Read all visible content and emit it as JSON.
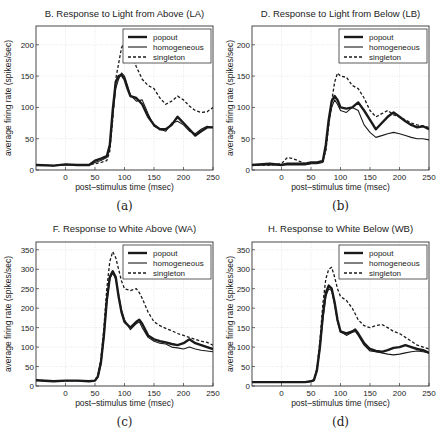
{
  "chart_data": [
    {
      "id": "a",
      "type": "line",
      "title": "B. Response to Light from Above (LA)",
      "xlabel": "post–stimulus time (msec)",
      "ylabel": "average firing rate (spikes/sec)",
      "caption": "(a)",
      "xlim": [
        -50,
        250
      ],
      "ylim": [
        0,
        230
      ],
      "xticks": [
        0,
        50,
        100,
        150,
        200,
        250
      ],
      "yticks": [
        0,
        50,
        100,
        150,
        200
      ],
      "grid": true,
      "legend_position": "upper right",
      "x": [
        -50,
        -20,
        0,
        20,
        40,
        50,
        60,
        70,
        75,
        80,
        85,
        90,
        95,
        100,
        105,
        110,
        120,
        130,
        140,
        150,
        160,
        170,
        180,
        190,
        200,
        210,
        220,
        230,
        240,
        250
      ],
      "series": [
        {
          "name": "popout",
          "style": "thick-solid",
          "values": [
            8,
            7,
            9,
            8,
            8,
            15,
            18,
            22,
            40,
            95,
            140,
            150,
            152,
            145,
            130,
            118,
            115,
            105,
            85,
            72,
            65,
            65,
            72,
            85,
            75,
            65,
            55,
            62,
            68,
            68
          ]
        },
        {
          "name": "homogeneous",
          "style": "thin-solid",
          "values": [
            8,
            7,
            8,
            8,
            8,
            12,
            15,
            20,
            35,
            85,
            130,
            145,
            155,
            150,
            135,
            120,
            110,
            112,
            90,
            70,
            65,
            62,
            75,
            78,
            72,
            62,
            58,
            65,
            70,
            68
          ]
        },
        {
          "name": "singleton",
          "style": "dashed",
          "values": [
            8,
            7,
            9,
            8,
            8,
            10,
            12,
            15,
            30,
            80,
            145,
            170,
            195,
            205,
            205,
            190,
            165,
            145,
            135,
            130,
            115,
            105,
            110,
            118,
            112,
            102,
            95,
            92,
            93,
            100
          ]
        }
      ]
    },
    {
      "id": "b",
      "type": "line",
      "title": "D. Response to Light from Below (LB)",
      "xlabel": "post–stimulus time (msec)",
      "ylabel": "average firing rate (spikes/sec)",
      "caption": "(b)",
      "xlim": [
        -50,
        250
      ],
      "ylim": [
        0,
        230
      ],
      "xticks": [
        0,
        50,
        100,
        150,
        200,
        250
      ],
      "yticks": [
        0,
        50,
        100,
        150,
        200
      ],
      "grid": true,
      "legend_position": "upper right",
      "x": [
        -50,
        -20,
        0,
        10,
        20,
        40,
        50,
        60,
        70,
        75,
        80,
        85,
        90,
        95,
        100,
        110,
        120,
        130,
        140,
        150,
        160,
        170,
        180,
        190,
        200,
        210,
        220,
        230,
        240,
        250
      ],
      "series": [
        {
          "name": "popout",
          "style": "thick-solid",
          "values": [
            8,
            10,
            8,
            10,
            10,
            10,
            12,
            12,
            14,
            40,
            80,
            110,
            118,
            112,
            100,
            98,
            100,
            108,
            95,
            80,
            65,
            75,
            85,
            92,
            85,
            78,
            72,
            68,
            70,
            65
          ]
        },
        {
          "name": "homogeneous",
          "style": "thin-solid",
          "values": [
            8,
            8,
            8,
            8,
            8,
            8,
            10,
            10,
            12,
            35,
            75,
            100,
            112,
            105,
            95,
            92,
            100,
            95,
            72,
            60,
            52,
            55,
            58,
            60,
            58,
            55,
            52,
            50,
            50,
            48
          ]
        },
        {
          "name": "singleton",
          "style": "dashed",
          "values": [
            8,
            8,
            10,
            20,
            18,
            10,
            10,
            12,
            15,
            30,
            70,
            110,
            140,
            155,
            150,
            148,
            135,
            130,
            115,
            95,
            85,
            90,
            95,
            88,
            85,
            80,
            75,
            72,
            70,
            68
          ]
        }
      ]
    },
    {
      "id": "c",
      "type": "line",
      "title": "F. Response to White Above (WA)",
      "xlabel": "post–stimulus time (msec)",
      "ylabel": "average firing rate (spikes/sec)",
      "caption": "(c)",
      "xlim": [
        -50,
        250
      ],
      "ylim": [
        0,
        370
      ],
      "xticks": [
        0,
        50,
        100,
        150,
        200,
        250
      ],
      "yticks": [
        0,
        50,
        100,
        150,
        200,
        250,
        300,
        350
      ],
      "grid": true,
      "legend_position": "upper right",
      "x": [
        -50,
        -20,
        0,
        20,
        40,
        50,
        55,
        60,
        65,
        70,
        75,
        80,
        85,
        90,
        95,
        100,
        110,
        120,
        125,
        130,
        140,
        150,
        160,
        170,
        180,
        190,
        200,
        210,
        220,
        230,
        240,
        250
      ],
      "series": [
        {
          "name": "popout",
          "style": "thick-solid",
          "values": [
            15,
            12,
            14,
            14,
            12,
            14,
            25,
            60,
            130,
            220,
            280,
            295,
            280,
            230,
            190,
            165,
            150,
            165,
            170,
            160,
            130,
            120,
            115,
            112,
            108,
            105,
            110,
            120,
            110,
            105,
            100,
            95
          ]
        },
        {
          "name": "homogeneous",
          "style": "thin-solid",
          "values": [
            15,
            12,
            14,
            14,
            12,
            14,
            22,
            55,
            125,
            215,
            275,
            290,
            275,
            235,
            195,
            170,
            145,
            160,
            165,
            150,
            125,
            115,
            110,
            108,
            100,
            98,
            95,
            100,
            95,
            92,
            90,
            88
          ]
        },
        {
          "name": "singleton",
          "style": "dashed",
          "values": [
            15,
            12,
            14,
            14,
            12,
            14,
            28,
            70,
            150,
            250,
            320,
            345,
            330,
            300,
            270,
            250,
            245,
            250,
            240,
            225,
            190,
            165,
            155,
            148,
            142,
            135,
            130,
            125,
            120,
            115,
            112,
            105
          ]
        }
      ]
    },
    {
      "id": "d",
      "type": "line",
      "title": "H. Response to White Below (WB)",
      "xlabel": "post–stimulus time (msec)",
      "ylabel": "average firing rate (spikes/sec)",
      "caption": "(d)",
      "xlim": [
        -50,
        250
      ],
      "ylim": [
        0,
        370
      ],
      "xticks": [
        0,
        50,
        100,
        150,
        200,
        250
      ],
      "yticks": [
        0,
        50,
        100,
        150,
        200,
        250,
        300,
        350
      ],
      "grid": true,
      "legend_position": "upper right",
      "x": [
        -50,
        -20,
        0,
        20,
        40,
        50,
        55,
        60,
        65,
        70,
        75,
        80,
        85,
        90,
        95,
        100,
        110,
        120,
        125,
        130,
        140,
        150,
        160,
        170,
        180,
        190,
        200,
        210,
        220,
        230,
        240,
        250
      ],
      "series": [
        {
          "name": "popout",
          "style": "thick-solid",
          "values": [
            10,
            10,
            10,
            10,
            10,
            12,
            15,
            40,
            100,
            180,
            240,
            258,
            250,
            215,
            170,
            140,
            135,
            140,
            145,
            135,
            110,
            95,
            90,
            88,
            92,
            98,
            100,
            105,
            100,
            95,
            92,
            85
          ]
        },
        {
          "name": "homogeneous",
          "style": "thin-solid",
          "values": [
            10,
            10,
            10,
            10,
            10,
            12,
            14,
            38,
            95,
            170,
            230,
            250,
            245,
            210,
            165,
            140,
            130,
            138,
            140,
            130,
            105,
            90,
            88,
            85,
            82,
            80,
            82,
            85,
            88,
            90,
            88,
            85
          ]
        },
        {
          "name": "singleton",
          "style": "dashed",
          "values": [
            10,
            10,
            10,
            10,
            10,
            12,
            16,
            45,
            115,
            210,
            275,
            300,
            305,
            280,
            250,
            230,
            220,
            200,
            185,
            170,
            155,
            150,
            155,
            158,
            150,
            140,
            135,
            125,
            115,
            105,
            100,
            95
          ]
        }
      ]
    }
  ]
}
